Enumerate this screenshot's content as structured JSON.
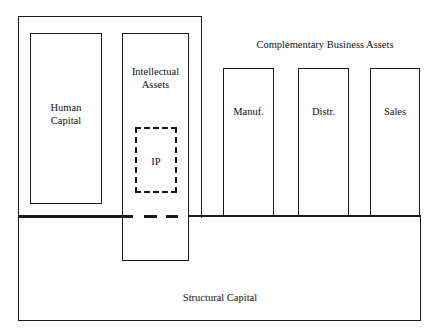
{
  "diagram": {
    "nodes": {
      "human_capital_group": {
        "label": ""
      },
      "human_capital": {
        "label_line1": "Human",
        "label_line2": "Capital"
      },
      "intellectual_assets": {
        "label_line1": "Intellectual",
        "label_line2": "Assets"
      },
      "ip": {
        "label": "IP"
      },
      "complementary_business_assets": {
        "label": "Complementary Business Assets"
      },
      "manufacturing": {
        "label": "Manuf."
      },
      "distribution": {
        "label": "Distr."
      },
      "sales": {
        "label": "Sales"
      },
      "structural_capital": {
        "label": "Structural Capital"
      }
    },
    "colors": {
      "line": "#1a1a1a",
      "background": "#ffffff"
    }
  }
}
